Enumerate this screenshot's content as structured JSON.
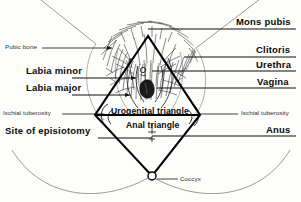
{
  "figure": {
    "ink_color": "#0a0a0a",
    "line_color": "#111111",
    "faint_color": "#8a8a8a",
    "background": "#fdfdfb"
  },
  "labels": {
    "mons_pubis": "Mons pubis",
    "clitoris": "Clitoris",
    "urethra": "Urethra",
    "vagina": "Vagina",
    "anus": "Anus",
    "ischial_tuberosity_right": "Ischial tuberosity",
    "ischial_tuberosity_left": "Ischial tuberosity",
    "pubic_bone": "Pubic bone",
    "labia_minor": "Labia minor",
    "labia_major": "Labia major",
    "site_of_episiotomy": "Site of episiotomy",
    "urogenital_triangle": "Urogenital triangle",
    "anal_triangle": "Anal triangle",
    "coccyx": "Coccyx"
  }
}
